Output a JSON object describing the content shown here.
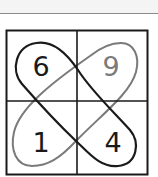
{
  "puzzle": {
    "grid": {
      "rows": 2,
      "cols": 2,
      "line_color": "#1a1a1a"
    },
    "cells": [
      {
        "row": 0,
        "col": 0,
        "value": "6",
        "color": "#1a1a1a"
      },
      {
        "row": 0,
        "col": 1,
        "value": "9",
        "color": "#7a7a7a"
      },
      {
        "row": 1,
        "col": 0,
        "value": "1",
        "color": "#1a1a1a"
      },
      {
        "row": 1,
        "col": 1,
        "value": "4",
        "color": "#1a1a1a"
      }
    ],
    "loops": [
      {
        "name": "black-loop",
        "connects": [
          "6",
          "4"
        ],
        "color": "#1a1a1a"
      },
      {
        "name": "gray-loop",
        "connects": [
          "9",
          "1"
        ],
        "color": "#7a7a7a"
      }
    ]
  }
}
